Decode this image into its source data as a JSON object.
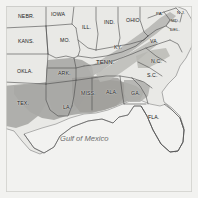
{
  "map": {
    "title": "Map of the Southeastern and Central United States",
    "frame_color": "#d8d8d4",
    "land_color": "#e9e9e6",
    "water_color": "#f2f2f0",
    "highlight_color": "#a9a9a5",
    "border_color": "#555555",
    "label_color": "#1a1a1a",
    "ocean_label": "Gulf of Mexico",
    "state_labels": [
      {
        "id": "nebraska",
        "text": "NEBR.",
        "x": 18,
        "y": 13,
        "size": "normal",
        "rotate": 0
      },
      {
        "id": "iowa",
        "text": "IOWA",
        "x": 51,
        "y": 11,
        "size": "normal",
        "rotate": 0
      },
      {
        "id": "illinois",
        "text": "ILL.",
        "x": 82,
        "y": 24,
        "size": "normal",
        "rotate": 0
      },
      {
        "id": "indiana",
        "text": "IND.",
        "x": 104,
        "y": 19,
        "size": "normal",
        "rotate": 0
      },
      {
        "id": "ohio",
        "text": "OHIO",
        "x": 126,
        "y": 17,
        "size": "normal",
        "rotate": 0
      },
      {
        "id": "pennsylvania",
        "text": "PA.",
        "x": 156,
        "y": 11,
        "size": "tiny",
        "rotate": 0
      },
      {
        "id": "new-jersey",
        "text": "N.J.",
        "x": 177,
        "y": 10,
        "size": "tiny",
        "rotate": 0
      },
      {
        "id": "maryland",
        "text": "MD.",
        "x": 171,
        "y": 18,
        "size": "tiny",
        "rotate": 0
      },
      {
        "id": "delaware",
        "text": "DEL.",
        "x": 170,
        "y": 27,
        "size": "tiny",
        "rotate": 0
      },
      {
        "id": "kansas",
        "text": "KANS.",
        "x": 18,
        "y": 38,
        "size": "normal",
        "rotate": 0
      },
      {
        "id": "missouri",
        "text": "MO.",
        "x": 60,
        "y": 37,
        "size": "normal",
        "rotate": 0
      },
      {
        "id": "kentucky",
        "text": "KY.",
        "x": 114,
        "y": 44,
        "size": "normal",
        "rotate": 0
      },
      {
        "id": "virginia",
        "text": "VA.",
        "x": 150,
        "y": 38,
        "size": "normal",
        "rotate": 0
      },
      {
        "id": "oklahoma",
        "text": "OKLA.",
        "x": 17,
        "y": 68,
        "size": "normal",
        "rotate": 0
      },
      {
        "id": "arkansas",
        "text": "ARK.",
        "x": 58,
        "y": 70,
        "size": "normal",
        "rotate": 0
      },
      {
        "id": "tennessee",
        "text": "TENN.",
        "x": 96,
        "y": 59,
        "size": "big",
        "rotate": 0
      },
      {
        "id": "north-carolina",
        "text": "N.C.",
        "x": 151,
        "y": 58,
        "size": "normal",
        "rotate": 0
      },
      {
        "id": "south-carolina",
        "text": "S.C.",
        "x": 147,
        "y": 72,
        "size": "normal",
        "rotate": 0
      },
      {
        "id": "texas",
        "text": "TEX.",
        "x": 17,
        "y": 100,
        "size": "normal",
        "rotate": 0
      },
      {
        "id": "louisiana",
        "text": "LA.",
        "x": 63,
        "y": 104,
        "size": "normal",
        "rotate": 0
      },
      {
        "id": "mississippi",
        "text": "MISS.",
        "x": 81,
        "y": 90,
        "size": "normal",
        "rotate": 0
      },
      {
        "id": "alabama",
        "text": "ALA.",
        "x": 106,
        "y": 89,
        "size": "normal",
        "rotate": 0
      },
      {
        "id": "georgia",
        "text": "GA.",
        "x": 131,
        "y": 90,
        "size": "normal",
        "rotate": 0
      },
      {
        "id": "florida",
        "text": "FLA.",
        "x": 148,
        "y": 114,
        "size": "normal",
        "rotate": 0
      }
    ]
  }
}
